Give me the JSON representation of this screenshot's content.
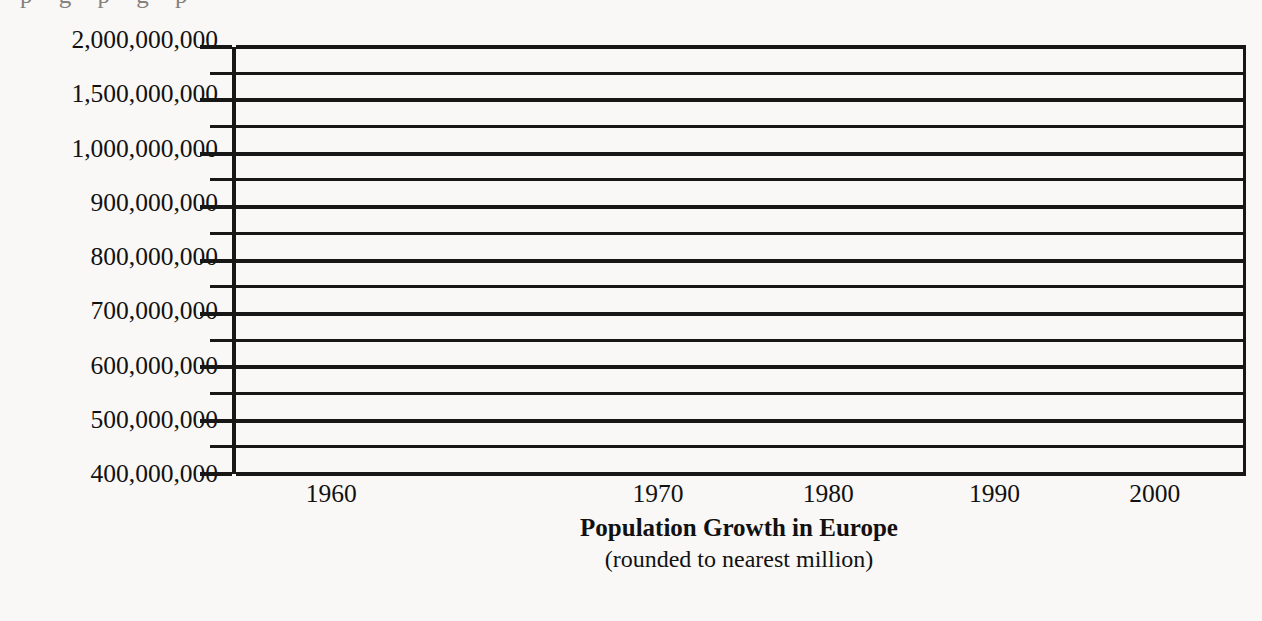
{
  "page": {
    "background_color": "#f9f8f6",
    "ink_color": "#171717",
    "top_fragment_text": "p g p g p"
  },
  "chart_data": {
    "type": "line",
    "title": "Population Growth in Europe",
    "subtitle": "(rounded to nearest million)",
    "xlabel": "",
    "ylabel": "",
    "series": [],
    "categories": [
      "1960",
      "1970",
      "1980",
      "1990",
      "2000"
    ],
    "x_tick_labels": [
      "1960",
      "1970",
      "1980",
      "1990",
      "2000"
    ],
    "x_tick_positions_pct": [
      9.8,
      42.0,
      58.8,
      75.2,
      91.0
    ],
    "y_tick_labels": [
      "2,000,000,000",
      "1,500,000,000",
      "1,000,000,000",
      "900,000,000",
      "800,000,000",
      "700,000,000",
      "600,000,000",
      "500,000,000",
      "400,000,000"
    ],
    "y_tick_values": [
      2000000000,
      1500000000,
      1000000000,
      900000000,
      800000000,
      700000000,
      600000000,
      500000000,
      400000000
    ],
    "y_axis_scale": "non-linear category axis (equal spacing per labeled tick)",
    "minor_gridlines_between_majors": 1,
    "total_gridlines": 17,
    "grid": true,
    "legend": "none",
    "plot_empty": true,
    "note": "Blank grid template: axes and gridlines are drawn but no data points, bars or lines are plotted."
  },
  "axis": {
    "y_major_positions_pct": [
      0,
      12.5,
      25,
      37.5,
      50,
      62.5,
      75,
      87.5,
      100
    ],
    "y_minor_positions_pct": [
      6.25,
      18.75,
      31.25,
      43.75,
      56.25,
      68.75,
      81.25,
      93.75
    ]
  }
}
